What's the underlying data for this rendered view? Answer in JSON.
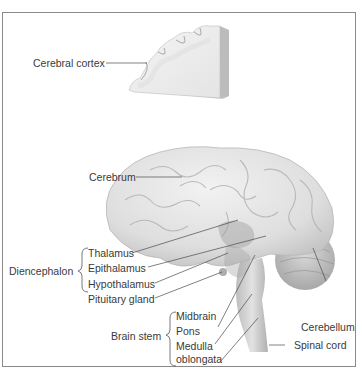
{
  "diagram": {
    "type": "anatomical-illustration",
    "colors": {
      "frame": "#8a8a8a",
      "label_text": "#3a3a3a",
      "leader_line": "#4a4a4a",
      "brain_fill": "#e6e6e6",
      "brain_shade": "#c8c8c8",
      "deep_structure": "#a8a8a8"
    }
  },
  "labels": {
    "cerebral_cortex": "Cerebral cortex",
    "cerebrum": "Cerebrum",
    "diencephalon": "Diencephalon",
    "thalamus": "Thalamus",
    "epithalamus": "Epithalamus",
    "hypothalamus": "Hypothalamus",
    "pituitary_gland": "Pituitary gland",
    "brain_stem": "Brain stem",
    "midbrain": "Midbrain",
    "pons": "Pons",
    "medulla_line1": "Medulla",
    "medulla_line2": "oblongata",
    "cerebellum": "Cerebellum",
    "spinal_cord": "Spinal cord"
  },
  "groups": [
    {
      "name": "Diencephalon",
      "members": [
        "Thalamus",
        "Epithalamus",
        "Hypothalamus"
      ]
    },
    {
      "name": "Brain stem",
      "members": [
        "Midbrain",
        "Pons",
        "Medulla oblongata"
      ]
    }
  ]
}
